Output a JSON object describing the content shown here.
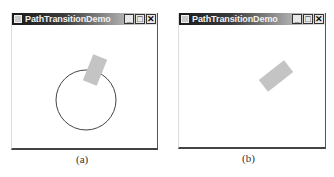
{
  "figures": [
    {
      "caption": "(a)",
      "window": {
        "title": "PathTransitionDemo",
        "controls": {
          "minimize": "_",
          "maximize": "□",
          "close": "✕"
        }
      },
      "scene": {
        "circle": {
          "cx": 74,
          "cy": 75,
          "r": 30,
          "stroke": "#444444",
          "fill": "none"
        },
        "rectangle": {
          "cx": 83,
          "cy": 45,
          "width": 15,
          "height": 28,
          "rotate": 22,
          "fill": "#c4c4c4"
        }
      }
    },
    {
      "caption": "(b)",
      "window": {
        "title": "PathTransitionDemo",
        "controls": {
          "minimize": "_",
          "maximize": "□",
          "close": "✕"
        }
      },
      "scene": {
        "rectangle": {
          "cx": 97,
          "cy": 51,
          "width": 15,
          "height": 32,
          "rotate": 52,
          "fill": "#c4c4c4"
        }
      }
    }
  ]
}
